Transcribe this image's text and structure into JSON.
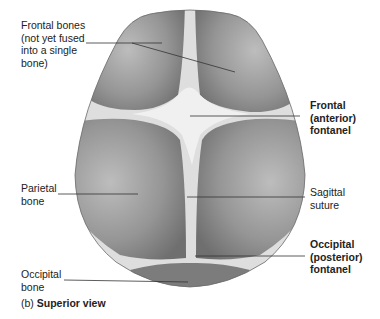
{
  "figure": {
    "caption_prefix": "(b)",
    "caption_title": "Superior view",
    "colors": {
      "bone_fill": "#8a8a8a",
      "bone_light": "#b8b8b8",
      "fontanel_fill": "#ececec",
      "suture_fill": "#dcdcdc",
      "leader_line": "#333333",
      "background": "#ffffff"
    },
    "labels": [
      {
        "id": "frontal-bones",
        "text": "Frontal bones\n(not yet fused\ninto a single\nbone)",
        "bold": false
      },
      {
        "id": "frontal-fontanel",
        "text": "Frontal\n(anterior)\nfontanel",
        "bold": true
      },
      {
        "id": "parietal-bone",
        "text": "Parietal\nbone",
        "bold": false
      },
      {
        "id": "sagittal-suture",
        "text": "Sagittal\nsuture",
        "bold": false
      },
      {
        "id": "occipital-fontanel",
        "text": "Occipital\n(posterior)\nfontanel",
        "bold": true
      },
      {
        "id": "occipital-bone",
        "text": "Occipital\nbone",
        "bold": false
      }
    ]
  }
}
